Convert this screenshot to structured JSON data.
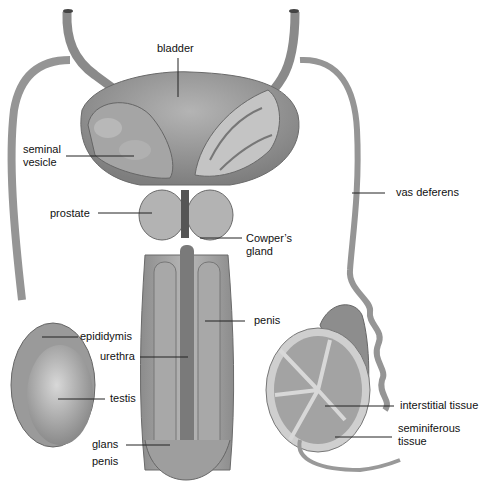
{
  "diagram": {
    "type": "anatomical illustration",
    "colors": {
      "background": "#ffffff",
      "tissue": "#9a9a9a",
      "tissue_dark": "#6f6f6f",
      "tissue_light": "#c9c9c9",
      "leader_line": "#222222",
      "text": "#111111"
    },
    "labels": {
      "bladder": "bladder",
      "seminal_vesicle_1": "seminal",
      "seminal_vesicle_2": "vesicle",
      "prostate": "prostate",
      "cowpers_gland_1": "Cowper’s",
      "cowpers_gland_2": "gland",
      "vas_deferens": "vas deferens",
      "penis": "penis",
      "epididymis": "epididymis",
      "urethra": "urethra",
      "testis": "testis",
      "glans_penis_1": "glans",
      "glans_penis_2": "penis",
      "interstitial_tissue": "interstitial tissue",
      "seminiferous_tissue_1": "seminiferous",
      "seminiferous_tissue_2": "tissue"
    }
  }
}
